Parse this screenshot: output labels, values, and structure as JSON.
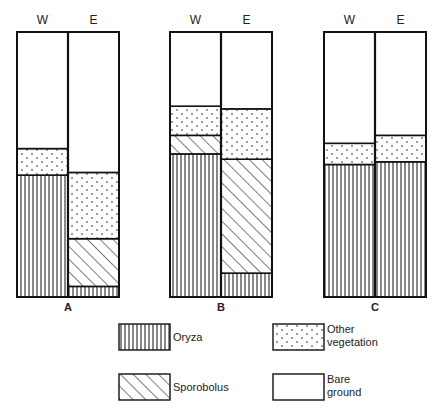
{
  "chart_data": {
    "type": "bar",
    "subtype": "stacked-100-percent",
    "title": "",
    "xlabel": "",
    "ylabel": "",
    "ylim": [
      0,
      100
    ],
    "grid": false,
    "legend_position": "bottom",
    "column_labels": [
      "W",
      "E"
    ],
    "legend": [
      {
        "key": "oryza",
        "label": "Oryza",
        "pattern": "vertical-lines"
      },
      {
        "key": "sporobolus",
        "label": "Sporobolus",
        "pattern": "diagonal-lines"
      },
      {
        "key": "other",
        "label": "Other vegetation",
        "label_lines": [
          "Other",
          "vegetation"
        ],
        "pattern": "dots"
      },
      {
        "key": "bare",
        "label": "Bare ground",
        "label_lines": [
          "Bare",
          "ground"
        ],
        "pattern": "blank"
      }
    ],
    "stack_order_bottom_to_top": [
      "oryza",
      "sporobolus",
      "other",
      "bare"
    ],
    "panels": [
      {
        "label": "A",
        "bars": [
          {
            "label": "W",
            "oryza": 46,
            "sporobolus": 0,
            "other": 10,
            "bare": 44
          },
          {
            "label": "E",
            "oryza": 4,
            "sporobolus": 18,
            "other": 25,
            "bare": 53
          }
        ]
      },
      {
        "label": "B",
        "bars": [
          {
            "label": "W",
            "oryza": 54,
            "sporobolus": 7,
            "other": 11,
            "bare": 28
          },
          {
            "label": "E",
            "oryza": 9,
            "sporobolus": 43,
            "other": 19,
            "bare": 29
          }
        ]
      },
      {
        "label": "C",
        "bars": [
          {
            "label": "W",
            "oryza": 50,
            "sporobolus": 0,
            "other": 8,
            "bare": 42
          },
          {
            "label": "E",
            "oryza": 51,
            "sporobolus": 0,
            "other": 10,
            "bare": 39
          }
        ]
      }
    ]
  },
  "layout": {
    "panel_x": [
      17,
      170,
      324
    ],
    "bar_width": 51,
    "top": 32,
    "bottom": 297,
    "legend_items": [
      {
        "key": "oryza",
        "x": 119,
        "y": 324
      },
      {
        "key": "sporobolus",
        "x": 119,
        "y": 374
      },
      {
        "key": "other",
        "x": 273,
        "y": 324
      },
      {
        "key": "bare",
        "x": 273,
        "y": 374
      }
    ],
    "legend_box": {
      "w": 51,
      "h": 26
    }
  }
}
